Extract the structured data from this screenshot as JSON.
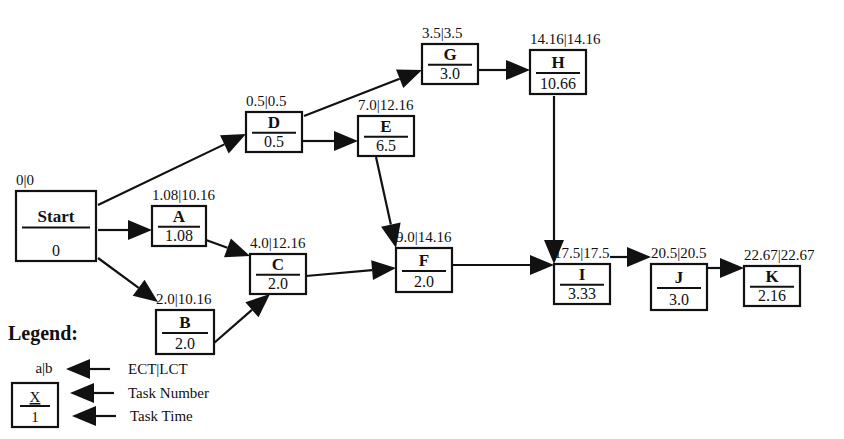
{
  "diagram": {
    "type": "network-diagram",
    "nodes": [
      {
        "id": "Start",
        "name": "Start",
        "time": "0",
        "ect_lct": "0|0"
      },
      {
        "id": "A",
        "name": "A",
        "time": "1.08",
        "ect_lct": "1.08|10.16"
      },
      {
        "id": "B",
        "name": "B",
        "time": "2.0",
        "ect_lct": "2.0|10.16"
      },
      {
        "id": "C",
        "name": "C",
        "time": "2.0",
        "ect_lct": "4.0|12.16"
      },
      {
        "id": "D",
        "name": "D",
        "time": "0.5",
        "ect_lct": "0.5|0.5"
      },
      {
        "id": "E",
        "name": "E",
        "time": "6.5",
        "ect_lct": "7.0|12.16"
      },
      {
        "id": "F",
        "name": "F",
        "time": "2.0",
        "ect_lct": "9.0|14.16"
      },
      {
        "id": "G",
        "name": "G",
        "time": "3.0",
        "ect_lct": "3.5|3.5"
      },
      {
        "id": "H",
        "name": "H",
        "time": "10.66",
        "ect_lct": "14.16|14.16"
      },
      {
        "id": "I",
        "name": "I",
        "time": "3.33",
        "ect_lct": "17.5|17.5"
      },
      {
        "id": "J",
        "name": "J",
        "time": "3.0",
        "ect_lct": "20.5|20.5"
      },
      {
        "id": "K",
        "name": "K",
        "time": "2.16",
        "ect_lct": "22.67|22.67"
      }
    ],
    "edges": [
      {
        "from": "Start",
        "to": "D"
      },
      {
        "from": "Start",
        "to": "A"
      },
      {
        "from": "Start",
        "to": "B"
      },
      {
        "from": "A",
        "to": "C"
      },
      {
        "from": "B",
        "to": "C"
      },
      {
        "from": "D",
        "to": "G"
      },
      {
        "from": "D",
        "to": "E"
      },
      {
        "from": "E",
        "to": "F"
      },
      {
        "from": "C",
        "to": "F"
      },
      {
        "from": "G",
        "to": "H"
      },
      {
        "from": "H",
        "to": "I"
      },
      {
        "from": "F",
        "to": "I"
      },
      {
        "from": "I",
        "to": "J"
      },
      {
        "from": "J",
        "to": "K"
      }
    ]
  },
  "legend": {
    "title": "Legend:",
    "sample_ect_lct": "a|b",
    "sample_name": "X",
    "sample_time": "1",
    "items": [
      {
        "label": "ECT|LCT"
      },
      {
        "label": "Task Number"
      },
      {
        "label": "Task Time"
      }
    ]
  }
}
